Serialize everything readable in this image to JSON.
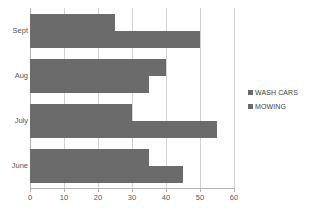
{
  "chart_data": {
    "type": "bar",
    "orientation": "horizontal",
    "title": "",
    "xlabel": "",
    "ylabel": "",
    "categories": [
      "Sept",
      "Aug",
      "July",
      "June"
    ],
    "series": [
      {
        "name": "WASH CARS",
        "values": [
          25,
          40,
          30,
          35
        ],
        "color": "#6b6b6b"
      },
      {
        "name": "MOWING",
        "values": [
          50,
          35,
          55,
          45
        ],
        "color": "#6b6b6b"
      }
    ],
    "xlim": [
      0,
      60
    ],
    "xticks": [
      0,
      10,
      20,
      30,
      40,
      50,
      60
    ],
    "xtick_labels": [
      "0",
      "10",
      "20",
      "30",
      "40",
      "50",
      "60"
    ],
    "grid": true,
    "grid_axis": "x",
    "legend": {
      "position": "right",
      "entries": [
        "WASH CARS",
        "MOWING"
      ]
    },
    "colors": {
      "bar": "#6b6b6b",
      "gridline": "#d2d2d2",
      "axis": "#b4b4b4",
      "tick_label": "#595959",
      "legend_text": "#404040",
      "background": "#ffffff"
    }
  }
}
